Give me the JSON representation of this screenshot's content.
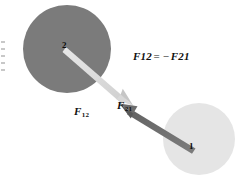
{
  "figure": {
    "background_color": "#ffffff",
    "width": 240,
    "height": 188,
    "bodies": [
      {
        "name": "body-2",
        "label": "2",
        "fill_color": "#7b7b7b",
        "cx": 67,
        "cy": 49,
        "r": 44,
        "label_x": 62,
        "label_y": 41
      },
      {
        "name": "body-1",
        "label": "1",
        "fill_color": "#e5e5e5",
        "cx": 199,
        "cy": 139,
        "r": 36,
        "label_x": 189,
        "label_y": 142
      }
    ],
    "forces": [
      {
        "name": "force-12",
        "label": "F",
        "subscript": "12",
        "color": "#d2d2d2",
        "x1": 67,
        "y1": 49,
        "x2": 128,
        "y2": 101,
        "label_x": 74,
        "label_y": 106
      },
      {
        "name": "force-21",
        "label": "F",
        "subscript": "21",
        "color": "#6e6e6e",
        "x1": 194,
        "y1": 146,
        "x2": 121,
        "y2": 102,
        "label_x": 117,
        "label_y": 100
      }
    ],
    "equation": {
      "lhs": "F",
      "lhs_sub": "12",
      "equals": "=",
      "minus": "−",
      "rhs": "F",
      "rhs_sub": "21"
    }
  }
}
